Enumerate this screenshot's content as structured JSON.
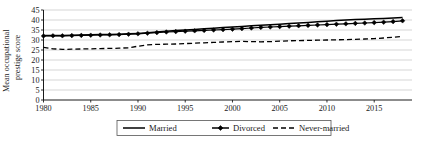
{
  "chart_data": {
    "type": "line",
    "title": "",
    "xlabel": "",
    "ylabel": "Mean occupational prestige score",
    "ylabel_line1": "Mean occupational",
    "ylabel_line2": "prestige score",
    "xlim": [
      1980,
      2019
    ],
    "ylim": [
      0,
      45
    ],
    "ytick_labels": [
      "45",
      "40",
      "35",
      "30",
      "25",
      "20",
      "15",
      "10",
      "5",
      "0"
    ],
    "yticks": [
      45,
      40,
      35,
      30,
      25,
      20,
      15,
      10,
      5,
      0
    ],
    "xtick_labels": [
      "1980",
      "1985",
      "1990",
      "1995",
      "2000",
      "2005",
      "2010",
      "2015"
    ],
    "xticks": [
      1980,
      1985,
      1990,
      1995,
      2000,
      2005,
      2010,
      2015
    ],
    "grid": "horizontal",
    "legend_position": "bottom-center",
    "x": [
      1980,
      1981,
      1982,
      1983,
      1984,
      1985,
      1986,
      1987,
      1988,
      1989,
      1990,
      1991,
      1992,
      1993,
      1994,
      1995,
      1996,
      1997,
      1998,
      1999,
      2000,
      2001,
      2002,
      2003,
      2004,
      2005,
      2006,
      2007,
      2008,
      2009,
      2010,
      2011,
      2012,
      2013,
      2014,
      2015,
      2016,
      2017,
      2018
    ],
    "series": [
      {
        "name": "Married",
        "style": "solid",
        "marker": "none",
        "color": "#000000",
        "values": [
          32.2,
          32.2,
          32.3,
          32.4,
          32.5,
          32.6,
          32.7,
          32.8,
          32.9,
          33.1,
          33.3,
          33.6,
          34.0,
          34.4,
          34.7,
          35.0,
          35.3,
          35.6,
          35.9,
          36.2,
          36.5,
          36.8,
          37.1,
          37.4,
          37.6,
          37.9,
          38.2,
          38.5,
          38.8,
          39.1,
          39.4,
          39.7,
          40.0,
          40.2,
          40.4,
          40.6,
          40.8,
          41.0,
          41.2
        ]
      },
      {
        "name": "Divorced",
        "style": "solid",
        "marker": "diamond",
        "color": "#000000",
        "values": [
          32.0,
          32.1,
          32.1,
          32.2,
          32.3,
          32.4,
          32.5,
          32.6,
          32.7,
          32.9,
          33.1,
          33.4,
          33.7,
          34.0,
          34.2,
          34.4,
          34.6,
          34.8,
          35.0,
          35.2,
          35.4,
          35.7,
          36.0,
          36.3,
          36.5,
          36.7,
          36.9,
          37.1,
          37.3,
          37.5,
          37.7,
          37.9,
          38.1,
          38.3,
          38.5,
          38.7,
          38.9,
          39.2,
          39.6
        ]
      },
      {
        "name": "Never-married",
        "style": "dashed",
        "marker": "none",
        "color": "#000000",
        "values": [
          26.3,
          25.6,
          25.3,
          25.4,
          25.5,
          25.6,
          25.7,
          25.8,
          25.9,
          26.1,
          26.9,
          27.6,
          27.8,
          27.9,
          28.0,
          28.2,
          28.4,
          28.6,
          28.8,
          29.0,
          29.2,
          29.3,
          29.2,
          29.1,
          29.2,
          29.4,
          29.6,
          29.7,
          29.8,
          29.9,
          30.0,
          30.1,
          30.2,
          30.3,
          30.5,
          30.7,
          31.0,
          31.4,
          31.8
        ]
      }
    ],
    "legend": [
      {
        "label": "Married",
        "style": "solid",
        "marker": "none"
      },
      {
        "label": "Divorced",
        "style": "solid",
        "marker": "diamond"
      },
      {
        "label": "Never-married",
        "style": "dashed",
        "marker": "none"
      }
    ]
  }
}
